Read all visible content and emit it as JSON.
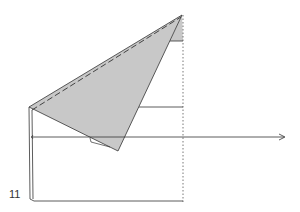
{
  "diagram": {
    "type": "origami-step",
    "step_number": "11",
    "colors": {
      "paper_shaded": "#c8c8c8",
      "line": "#333333",
      "background": "#ffffff"
    },
    "elements": [
      "shaded-triangle-flap",
      "dashed-valley-fold-line",
      "dotted-vertical-reference-line",
      "horizontal-arrow-right",
      "paper-outline-rectangle"
    ]
  }
}
